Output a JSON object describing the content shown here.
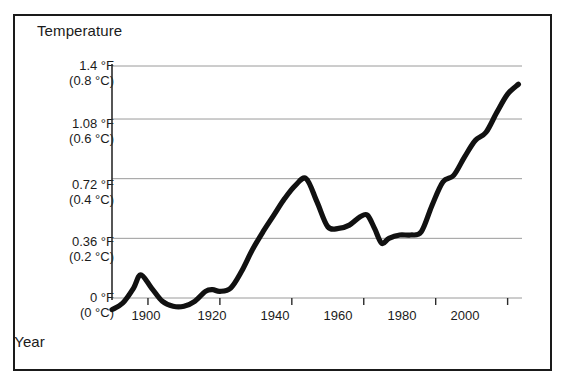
{
  "figure": {
    "border_color": "#1a1a1a",
    "background": "#ffffff"
  },
  "chart_data": {
    "type": "line",
    "title": "",
    "ylabel": "Temperature",
    "xlabel": "Year",
    "grid": true,
    "legend": null,
    "line_color": "#111111",
    "gridline_color": "#9a9a9a",
    "xlim": [
      1890,
      2004
    ],
    "ylim": [
      -0.09,
      1.4
    ],
    "xticks": [
      1900,
      1920,
      1940,
      1960,
      1980,
      2000
    ],
    "xtick_labels": [
      "1900",
      "1920",
      "1940",
      "1960",
      "1980",
      "2000"
    ],
    "yticks": [
      0,
      0.36,
      0.72,
      1.08,
      1.4
    ],
    "ytick_labels": [
      {
        "fahrenheit": "0 °F",
        "celsius": "(0 °C)"
      },
      {
        "fahrenheit": "0.36 °F",
        "celsius": "(0.2 °C)"
      },
      {
        "fahrenheit": "0.72 °F",
        "celsius": "(0.4 °C)"
      },
      {
        "fahrenheit": "1.08 °F",
        "celsius": "(0.6 °C)"
      },
      {
        "fahrenheit": "1.4 °F",
        "celsius": "(0.8 °C)"
      }
    ],
    "x": [
      1890,
      1893,
      1896,
      1898,
      1901,
      1904,
      1907,
      1910,
      1913,
      1916,
      1918,
      1920,
      1923,
      1926,
      1929,
      1932,
      1935,
      1938,
      1941,
      1944,
      1947,
      1950,
      1953,
      1956,
      1959,
      1961,
      1963,
      1965,
      1967,
      1970,
      1973,
      1976,
      1979,
      1982,
      1985,
      1988,
      1991,
      1994,
      1997,
      2000,
      2003
    ],
    "values": [
      -0.07,
      -0.03,
      0.06,
      0.14,
      0.06,
      -0.02,
      -0.05,
      -0.05,
      -0.02,
      0.04,
      0.05,
      0.04,
      0.06,
      0.16,
      0.29,
      0.4,
      0.5,
      0.6,
      0.68,
      0.72,
      0.58,
      0.43,
      0.42,
      0.44,
      0.49,
      0.5,
      0.42,
      0.33,
      0.36,
      0.38,
      0.38,
      0.4,
      0.56,
      0.7,
      0.74,
      0.85,
      0.95,
      1.0,
      1.12,
      1.23,
      1.29
    ],
    "units_note": "Values in °F anomaly; parenthetical axis labels give °C equivalents"
  }
}
